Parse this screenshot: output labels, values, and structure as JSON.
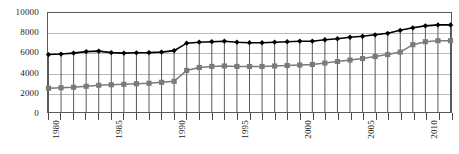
{
  "chart_data": {
    "type": "line",
    "title": "",
    "subtitle": "",
    "xlabel": "",
    "ylabel": "",
    "ylim": [
      0,
      10000
    ],
    "yticks": [
      0,
      2000,
      4000,
      6000,
      8000,
      10000
    ],
    "ytick_labels": [
      "0",
      "2000",
      "4000",
      "6000",
      "8000",
      "10000"
    ],
    "grid": true,
    "grid_axis": "y",
    "legend": "none",
    "x": [
      1980,
      1981,
      1982,
      1983,
      1984,
      1985,
      1986,
      1987,
      1988,
      1989,
      1990,
      1991,
      1992,
      1993,
      1994,
      1995,
      1996,
      1997,
      1998,
      1999,
      2000,
      2001,
      2002,
      2003,
      2004,
      2005,
      2006,
      2007,
      2008,
      2009,
      2010,
      2011,
      2012
    ],
    "xtick_labels": [
      "1980",
      "1985",
      "1990",
      "1995",
      "2000",
      "2005",
      "2010"
    ],
    "xticks_major": [
      1980,
      1985,
      1990,
      1995,
      2000,
      2005,
      2010
    ],
    "xlim": [
      1980,
      2012
    ],
    "drop_lines": true,
    "series": [
      {
        "name": "upper-series",
        "marker": "diamond",
        "color": "#000000",
        "values": [
          5800,
          5850,
          5950,
          6100,
          6150,
          6000,
          5950,
          5980,
          6000,
          6050,
          6200,
          6950,
          7050,
          7100,
          7150,
          7050,
          7000,
          7000,
          7050,
          7100,
          7150,
          7150,
          7300,
          7400,
          7550,
          7650,
          7800,
          7950,
          8250,
          8500,
          8700,
          8800,
          8800
        ]
      },
      {
        "name": "lower-series",
        "marker": "square",
        "color": "#7a7a7a",
        "values": [
          2400,
          2450,
          2500,
          2600,
          2700,
          2750,
          2800,
          2850,
          2900,
          3000,
          3100,
          4200,
          4500,
          4600,
          4650,
          4600,
          4600,
          4600,
          4650,
          4700,
          4750,
          4800,
          4950,
          5100,
          5250,
          5400,
          5600,
          5800,
          6050,
          6800,
          7100,
          7200,
          7200
        ]
      }
    ]
  }
}
